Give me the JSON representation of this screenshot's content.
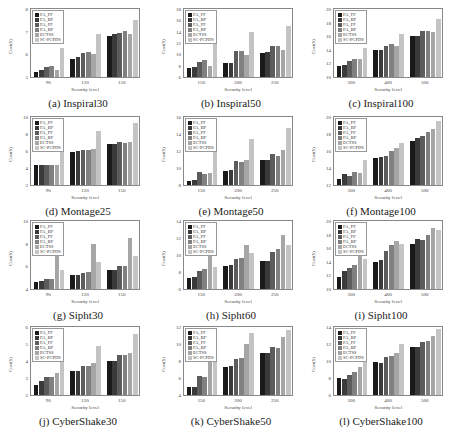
{
  "legend": [
    "FA_FF",
    "FA_BF",
    "FA_FF",
    "FA_BF",
    "ECTSS",
    "SC-PCPDS"
  ],
  "series_colors": [
    "#1a1a1a",
    "#3a3a3a",
    "#5c5c5c",
    "#808080",
    "#a6a6a6",
    "#c4c4c4"
  ],
  "xlabel": "Security level",
  "ylabel": "Cost($)",
  "chart_data": [
    {
      "type": "bar",
      "title": "(a) Inspiral30",
      "categories": [
        "90",
        "120",
        "150"
      ],
      "ylim": [
        5,
        8
      ],
      "yticks": [
        5,
        6,
        7,
        8
      ],
      "series": [
        {
          "name": "FA_FF",
          "values": [
            5.2,
            5.8,
            6.8
          ]
        },
        {
          "name": "FA_BF",
          "values": [
            5.3,
            5.9,
            6.9
          ]
        },
        {
          "name": "FA_FF",
          "values": [
            5.45,
            6.05,
            6.95
          ]
        },
        {
          "name": "FA_BF",
          "values": [
            5.5,
            6.1,
            7.05
          ]
        },
        {
          "name": "ECTSS",
          "values": [
            5.3,
            6.0,
            6.9
          ]
        },
        {
          "name": "SC-PCPDS",
          "values": [
            6.3,
            6.9,
            7.5
          ]
        }
      ]
    },
    {
      "type": "bar",
      "title": "(b) Inspiral50",
      "categories": [
        "150",
        "200",
        "250"
      ],
      "ylim": [
        6,
        18
      ],
      "yticks": [
        6,
        8,
        10,
        12,
        14,
        16,
        18
      ],
      "series": [
        {
          "name": "FA_FF",
          "values": [
            7.6,
            8.4,
            10.3
          ]
        },
        {
          "name": "FA_BF",
          "values": [
            7.8,
            8.4,
            10.4
          ]
        },
        {
          "name": "FA_FF",
          "values": [
            8.6,
            10.6,
            11.4
          ]
        },
        {
          "name": "FA_BF",
          "values": [
            9.0,
            10.6,
            11.5
          ]
        },
        {
          "name": "ECTSS",
          "values": [
            8.0,
            9.8,
            10.7
          ]
        },
        {
          "name": "SC-PCPDS",
          "values": [
            12.7,
            13.9,
            15.0
          ]
        }
      ]
    },
    {
      "type": "bar",
      "title": "(c) Inspiral100",
      "categories": [
        "300",
        "400",
        "500"
      ],
      "ylim": [
        10,
        20
      ],
      "yticks": [
        10,
        12,
        14,
        16,
        18,
        20
      ],
      "series": [
        {
          "name": "FA_FF",
          "values": [
            11.6,
            14.0,
            16.0
          ]
        },
        {
          "name": "FA_BF",
          "values": [
            11.7,
            14.0,
            16.1
          ]
        },
        {
          "name": "FA_FF",
          "values": [
            12.3,
            14.6,
            16.8
          ]
        },
        {
          "name": "FA_BF",
          "values": [
            12.6,
            14.8,
            16.8
          ]
        },
        {
          "name": "ECTSS",
          "values": [
            12.6,
            14.5,
            16.6
          ]
        },
        {
          "name": "SC-PCPDS",
          "values": [
            14.3,
            16.3,
            18.5
          ]
        }
      ]
    },
    {
      "type": "bar",
      "title": "(d) Montage25",
      "categories": [
        "90",
        "120",
        "150"
      ],
      "ylim": [
        2,
        10
      ],
      "yticks": [
        2,
        4,
        6,
        8,
        10
      ],
      "series": [
        {
          "name": "FA_FF",
          "values": [
            4.3,
            5.9,
            6.8
          ]
        },
        {
          "name": "FA_BF",
          "values": [
            4.3,
            6.0,
            6.8
          ]
        },
        {
          "name": "FA_FF",
          "values": [
            4.3,
            6.1,
            7.1
          ]
        },
        {
          "name": "FA_BF",
          "values": [
            4.3,
            6.1,
            6.9
          ]
        },
        {
          "name": "ECTSS",
          "values": [
            4.4,
            6.2,
            7.1
          ]
        },
        {
          "name": "SC-PCPDS",
          "values": [
            6.8,
            8.4,
            9.3
          ]
        }
      ]
    },
    {
      "type": "bar",
      "title": "(e) Montage50",
      "categories": [
        "150",
        "200",
        "250"
      ],
      "ylim": [
        8,
        16
      ],
      "yticks": [
        8,
        10,
        12,
        14,
        16
      ],
      "series": [
        {
          "name": "FA_FF",
          "values": [
            8.5,
            9.6,
            10.9
          ]
        },
        {
          "name": "FA_BF",
          "values": [
            8.6,
            9.8,
            10.9
          ]
        },
        {
          "name": "FA_FF",
          "values": [
            9.5,
            10.8,
            11.7
          ]
        },
        {
          "name": "FA_BF",
          "values": [
            9.3,
            10.7,
            11.4
          ]
        },
        {
          "name": "ECTSS",
          "values": [
            9.4,
            11.0,
            12.1
          ]
        },
        {
          "name": "SC-PCPDS",
          "values": [
            12.4,
            13.4,
            14.7
          ]
        }
      ]
    },
    {
      "type": "bar",
      "title": "(f) Montage100",
      "categories": [
        "300",
        "400",
        "500"
      ],
      "ylim": [
        12,
        20
      ],
      "yticks": [
        12,
        14,
        16,
        18,
        20
      ],
      "series": [
        {
          "name": "FA_FF",
          "values": [
            12.7,
            15.2,
            17.2
          ]
        },
        {
          "name": "FA_BF",
          "values": [
            13.3,
            15.3,
            17.5
          ]
        },
        {
          "name": "FA_FF",
          "values": [
            13.1,
            15.4,
            17.8
          ]
        },
        {
          "name": "FA_BF",
          "values": [
            13.5,
            16.0,
            18.2
          ]
        },
        {
          "name": "ECTSS",
          "values": [
            13.4,
            16.3,
            18.6
          ]
        },
        {
          "name": "SC-PCPDS",
          "values": [
            14.9,
            16.9,
            19.5
          ]
        }
      ]
    },
    {
      "type": "bar",
      "title": "(g) Sipht30",
      "categories": [
        "90",
        "120",
        "150"
      ],
      "ylim": [
        4,
        10
      ],
      "yticks": [
        4,
        6,
        8,
        10
      ],
      "series": [
        {
          "name": "FA_FF",
          "values": [
            4.6,
            5.2,
            5.7
          ]
        },
        {
          "name": "FA_BF",
          "values": [
            4.7,
            5.2,
            5.7
          ]
        },
        {
          "name": "FA_FF",
          "values": [
            4.9,
            5.4,
            6.0
          ]
        },
        {
          "name": "FA_BF",
          "values": [
            4.9,
            5.5,
            6.0
          ]
        },
        {
          "name": "ECTSS",
          "values": [
            7.3,
            8.0,
            8.5
          ]
        },
        {
          "name": "SC-PCPDS",
          "values": [
            5.7,
            6.4,
            6.9
          ]
        }
      ]
    },
    {
      "type": "bar",
      "title": "(h) Sipht60",
      "categories": [
        "150",
        "200",
        "250"
      ],
      "ylim": [
        6,
        14
      ],
      "yticks": [
        6,
        8,
        10,
        12,
        14
      ],
      "series": [
        {
          "name": "FA_FF",
          "values": [
            7.3,
            8.7,
            9.3
          ]
        },
        {
          "name": "FA_BF",
          "values": [
            7.4,
            8.8,
            9.3
          ]
        },
        {
          "name": "FA_FF",
          "values": [
            8.1,
            9.5,
            10.4
          ]
        },
        {
          "name": "FA_BF",
          "values": [
            8.3,
            9.7,
            10.7
          ]
        },
        {
          "name": "ECTSS",
          "values": [
            10.1,
            11.2,
            12.3
          ]
        },
        {
          "name": "SC-PCPDS",
          "values": [
            8.6,
            10.2,
            11.2
          ]
        }
      ]
    },
    {
      "type": "bar",
      "title": "(i) Sipht100",
      "categories": [
        "300",
        "400",
        "500"
      ],
      "ylim": [
        10,
        20
      ],
      "yticks": [
        10,
        12,
        14,
        16,
        18,
        20
      ],
      "series": [
        {
          "name": "FA_FF",
          "values": [
            11.7,
            14.0,
            16.6
          ]
        },
        {
          "name": "FA_BF",
          "values": [
            12.6,
            14.2,
            17.3
          ]
        },
        {
          "name": "FA_FF",
          "values": [
            13.1,
            15.6,
            17.2
          ]
        },
        {
          "name": "FA_BF",
          "values": [
            13.6,
            16.4,
            18.0
          ]
        },
        {
          "name": "ECTSS",
          "values": [
            14.9,
            17.0,
            19.0
          ]
        },
        {
          "name": "SC-PCPDS",
          "values": [
            14.4,
            16.6,
            18.7
          ]
        }
      ]
    },
    {
      "type": "bar",
      "title": "(j) CyberShake30",
      "categories": [
        "90",
        "120",
        "150"
      ],
      "ylim": [
        2,
        6
      ],
      "yticks": [
        2,
        3,
        4,
        5,
        6
      ],
      "series": [
        {
          "name": "FA_FF",
          "values": [
            2.6,
            3.4,
            4.0
          ]
        },
        {
          "name": "FA_BF",
          "values": [
            2.8,
            3.4,
            4.0
          ]
        },
        {
          "name": "FA_FF",
          "values": [
            3.05,
            3.7,
            4.35
          ]
        },
        {
          "name": "FA_BF",
          "values": [
            3.05,
            3.7,
            4.35
          ]
        },
        {
          "name": "ECTSS",
          "values": [
            3.3,
            3.9,
            4.5
          ]
        },
        {
          "name": "SC-PCPDS",
          "values": [
            4.2,
            4.9,
            5.6
          ]
        }
      ]
    },
    {
      "type": "bar",
      "title": "(k) CyberShake50",
      "categories": [
        "150",
        "200",
        "250"
      ],
      "ylim": [
        4,
        12
      ],
      "yticks": [
        4,
        6,
        8,
        10,
        12
      ],
      "series": [
        {
          "name": "FA_FF",
          "values": [
            4.9,
            7.3,
            8.9
          ]
        },
        {
          "name": "FA_BF",
          "values": [
            5.0,
            7.4,
            9.0
          ]
        },
        {
          "name": "FA_FF",
          "values": [
            6.2,
            8.2,
            9.6
          ]
        },
        {
          "name": "FA_BF",
          "values": [
            6.1,
            8.4,
            9.5
          ]
        },
        {
          "name": "ECTSS",
          "values": [
            8.9,
            10.0,
            10.8
          ]
        },
        {
          "name": "SC-PCPDS",
          "values": [
            10.0,
            11.3,
            11.6
          ]
        }
      ]
    },
    {
      "type": "bar",
      "title": "(l) CyberShake100",
      "categories": [
        "300",
        "400",
        "500"
      ],
      "ylim": [
        6,
        14
      ],
      "yticks": [
        6,
        8,
        10,
        12,
        14
      ],
      "series": [
        {
          "name": "FA_FF",
          "values": [
            8.0,
            9.9,
            11.7
          ]
        },
        {
          "name": "FA_BF",
          "values": [
            7.9,
            9.8,
            11.7
          ]
        },
        {
          "name": "FA_FF",
          "values": [
            8.4,
            10.5,
            12.2
          ]
        },
        {
          "name": "FA_BF",
          "values": [
            8.7,
            10.6,
            12.3
          ]
        },
        {
          "name": "ECTSS",
          "values": [
            9.3,
            11.0,
            13.0
          ]
        },
        {
          "name": "SC-PCPDS",
          "values": [
            10.0,
            12.0,
            13.8
          ]
        }
      ]
    }
  ]
}
